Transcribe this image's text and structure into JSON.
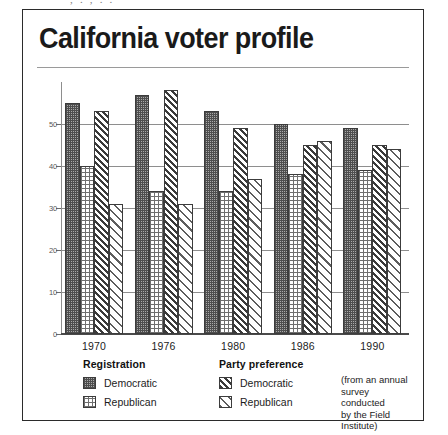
{
  "scan_artifact": {
    "top_clipped_text": "  ,       .    ,      .       .     "
  },
  "figure": {
    "title": "California voter profile"
  },
  "chart_data": {
    "type": "bar",
    "title": "California voter profile",
    "xlabel": "",
    "ylabel": "",
    "ylim": [
      0,
      60
    ],
    "yticks": [
      "0",
      "10",
      "20",
      "30",
      "40",
      "50"
    ],
    "grid": true,
    "legend_position": "bottom",
    "categories": [
      "1970",
      "1976",
      "1980",
      "1986",
      "1990"
    ],
    "series": [
      {
        "name": "Registration Democratic",
        "group": "Registration",
        "pattern": "dark-dotted",
        "values": [
          55,
          57,
          53,
          50,
          49
        ]
      },
      {
        "name": "Registration Republican",
        "group": "Registration",
        "pattern": "light-dotted",
        "values": [
          40,
          34,
          34,
          38,
          39
        ]
      },
      {
        "name": "Party preference Democratic",
        "group": "Party preference",
        "pattern": "dark-diagonal",
        "values": [
          53,
          58,
          49,
          45,
          45
        ]
      },
      {
        "name": "Party preference Republican",
        "group": "Party preference",
        "pattern": "light-diagonal",
        "values": [
          31,
          31,
          37,
          46,
          44
        ]
      }
    ],
    "annotations": [
      "(from an annual survey conducted by the Field Institute)"
    ]
  },
  "legend": {
    "registration": {
      "heading": "Registration",
      "items": [
        {
          "label": "Democratic",
          "pattern": "dark-dotted"
        },
        {
          "label": "Republican",
          "pattern": "light-dotted"
        }
      ]
    },
    "party_preference": {
      "heading": "Party preference",
      "items": [
        {
          "label": "Democratic",
          "pattern": "dark-diagonal"
        },
        {
          "label": "Republican",
          "pattern": "light-diagonal"
        }
      ]
    },
    "note": "(from an annual\n  survey conducted\n  by the Field Institute)"
  }
}
